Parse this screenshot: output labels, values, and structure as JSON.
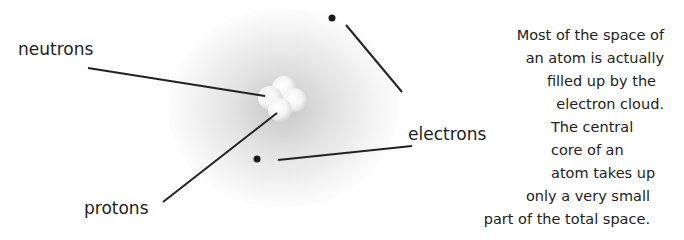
{
  "labels": {
    "neutrons": "neutrons",
    "protons": "protons",
    "electrons": "electrons"
  },
  "description": {
    "lines": [
      "Most of the space of",
      "an atom is actually",
      "filled up by the",
      "electron cloud.",
      "The central",
      "core of an",
      "atom takes up",
      "only a very small",
      "part of the total space."
    ]
  },
  "colors": {
    "line": "#222222",
    "electron": "#1a1a1a",
    "cloud": "#a0a0a0"
  }
}
